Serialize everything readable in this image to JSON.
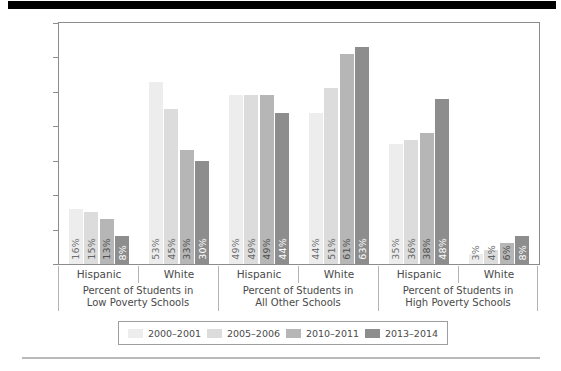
{
  "chart_data": {
    "type": "bar",
    "title": "",
    "xlabel": "",
    "ylabel": "",
    "ylim": [
      0,
      70
    ],
    "yticks": [
      0,
      10,
      20,
      30,
      40,
      50,
      60,
      70
    ],
    "grid": false,
    "legend_position": "bottom",
    "series": [
      {
        "name": "2000–2001",
        "color": "#ededed",
        "values": [
          16,
          53,
          49,
          44,
          35,
          3
        ],
        "labels": [
          "16%",
          "53%",
          "49%",
          "44%",
          "35%",
          "3%"
        ]
      },
      {
        "name": "2005–2006",
        "color": "#dcdcdc",
        "values": [
          15,
          45,
          49,
          51,
          36,
          4
        ],
        "labels": [
          "15%",
          "45%",
          "49%",
          "51%",
          "36%",
          "4%"
        ]
      },
      {
        "name": "2010–2011",
        "color": "#b6b6b6",
        "values": [
          13,
          33,
          49,
          61,
          38,
          6
        ],
        "labels": [
          "13%",
          "33%",
          "49%",
          "61%",
          "38%",
          "6%"
        ]
      },
      {
        "name": "2013–2014",
        "color": "#8d8d8d",
        "values": [
          8,
          30,
          44,
          63,
          48,
          8
        ],
        "labels": [
          "8%",
          "30%",
          "44%",
          "63%",
          "48%",
          "8%"
        ]
      }
    ],
    "categories": [
      "Hispanic",
      "White",
      "Hispanic",
      "White",
      "Hispanic",
      "White"
    ],
    "category_groups": [
      {
        "label_line1": "Percent of Students in",
        "label_line2": "Low Poverty Schools",
        "members": [
          "Hispanic",
          "White"
        ]
      },
      {
        "label_line1": "Percent of Students in",
        "label_line2": "All Other Schools",
        "members": [
          "Hispanic",
          "White"
        ]
      },
      {
        "label_line1": "Percent of Students in",
        "label_line2": "High Poverty Schools",
        "members": [
          "Hispanic",
          "White"
        ]
      }
    ]
  },
  "legend": {
    "items": [
      {
        "label": "2000–2001",
        "color": "#ededed"
      },
      {
        "label": "2005–2006",
        "color": "#dcdcdc"
      },
      {
        "label": "2010–2011",
        "color": "#b6b6b6"
      },
      {
        "label": "2013–2014",
        "color": "#8d8d8d"
      }
    ]
  },
  "axis": {
    "y_tick_labels": [
      "70",
      "60",
      "50",
      "40",
      "30",
      "20",
      "10",
      "0"
    ]
  }
}
